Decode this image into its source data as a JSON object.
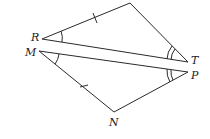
{
  "figure": {
    "type": "geometry",
    "labels": {
      "R": "R",
      "M": "M",
      "T": "T",
      "P": "P",
      "N": "N"
    },
    "marks": {
      "congruent_sides": [
        "RQ",
        "MN"
      ],
      "single_arc_angles": [
        "R",
        "M"
      ],
      "double_arc_angles": [
        "T",
        "P"
      ]
    },
    "color": "#2a2a2a"
  }
}
